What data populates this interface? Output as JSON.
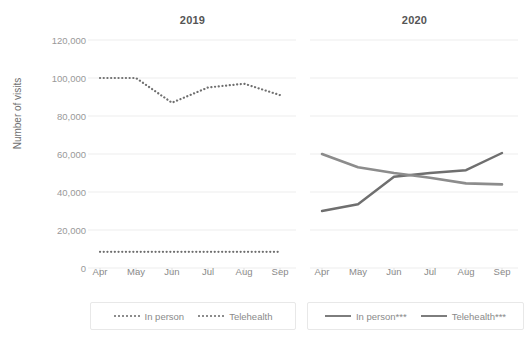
{
  "chart_data": {
    "type": "line",
    "title": "",
    "xlabel": "",
    "ylabel": "Number of visits",
    "ylim": [
      0,
      120000
    ],
    "yticks": [
      0,
      20000,
      40000,
      60000,
      80000,
      100000,
      120000
    ],
    "ytick_labels": [
      "0",
      "20,000",
      "40,000",
      "60,000",
      "80,000",
      "100,000",
      "120,000"
    ],
    "categories": [
      "Apr",
      "May",
      "Jun",
      "Jul",
      "Aug",
      "Sep"
    ],
    "grid": "horizontal",
    "legend_position": "bottom",
    "panels": [
      {
        "title": "2019",
        "legend": [
          {
            "label": "In person",
            "style": "dotted"
          },
          {
            "label": "Telehealth",
            "style": "dotted"
          }
        ],
        "series": [
          {
            "name": "In person",
            "style": "dotted",
            "values": [
              100000,
              100000,
              87000,
              95000,
              97000,
              91000
            ]
          },
          {
            "name": "Telehealth",
            "style": "dotted",
            "values": [
              8500,
              8500,
              8500,
              8500,
              8500,
              8500
            ]
          }
        ]
      },
      {
        "title": "2020",
        "legend": [
          {
            "label": "In person***",
            "style": "solid"
          },
          {
            "label": "Telehealth***",
            "style": "solid"
          }
        ],
        "series": [
          {
            "name": "In person***",
            "style": "solid",
            "values": [
              30000,
              33500,
              48000,
              50000,
              51500,
              60500
            ]
          },
          {
            "name": "Telehealth***",
            "style": "solid",
            "values": [
              60000,
              53000,
              50000,
              47500,
              44500,
              44000
            ]
          }
        ]
      }
    ]
  },
  "colors": {
    "line": "#7d7d7d",
    "grid": "#ededed",
    "tick_text": "#999999",
    "title_text": "#555555",
    "axis_title": "#6e6e6e",
    "legend_border": "#e8e8e8",
    "background": "#ffffff"
  }
}
